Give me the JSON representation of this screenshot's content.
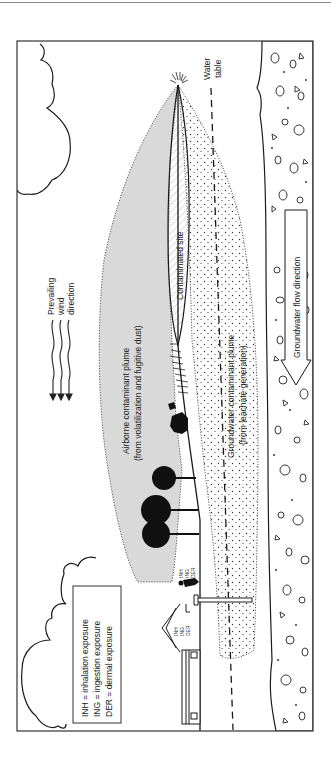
{
  "figure": {
    "orientation": "rotated-90-ccw",
    "labels": {
      "wind": [
        "Prevailing",
        "wind",
        "direction"
      ],
      "airborne_plume": [
        "Airborne contaminant plume",
        "(from volatilization and fugitive dust)"
      ],
      "contaminated_site": "Contaminated site",
      "groundwater_plume": [
        "Groundwater contaminant plume",
        "(from leachate generation)"
      ],
      "water_table": [
        "Water",
        "table"
      ],
      "groundwater_flow": "Groundwater flow direction",
      "receptor_person": [
        "INH",
        "ING",
        "DER"
      ],
      "receptor_house": [
        "INH",
        "ING",
        "DER"
      ]
    },
    "legend": {
      "items": [
        "INH = inhalation exposure",
        "ING = ingestion exposure",
        "DER = dermal exposure"
      ]
    },
    "colors": {
      "line": "#1a1a1a",
      "airborne_fill": "#d9d9d9",
      "background": "#ffffff",
      "frame": "#333333"
    }
  }
}
